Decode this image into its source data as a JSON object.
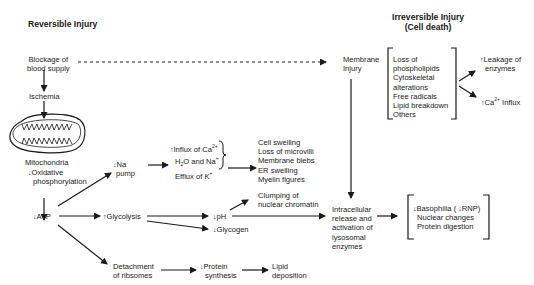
{
  "headings": {
    "reversible": "Reversible Injury",
    "irreversible_line1": "Irreversible Injury",
    "irreversible_line2": "(Cell death)"
  },
  "nodes": {
    "blockage": [
      "Blockage of",
      "blood supply"
    ],
    "ischemia": "Ischemia",
    "mitochondria": "Mitochondria",
    "oxidative": [
      "Oxidative",
      "phosphorylation"
    ],
    "atp": "ATP",
    "na_pump": [
      "Na",
      "pump"
    ],
    "influx": [
      "Influx of Ca",
      "H",
      "O  and Na",
      "Efflux of K"
    ],
    "swelling_list": [
      "Cell swelling",
      "Loss of microvilli",
      "Membrane blebs",
      "ER swelling",
      "Myelin figures"
    ],
    "glycolysis": "Glycolysis",
    "ph": "pH",
    "glycogen": "Glycogen",
    "clumping": [
      "Clumping of",
      "nuclear chromatin"
    ],
    "detachment": [
      "Detachment",
      "of ribsomes"
    ],
    "protein_synthesis": [
      "Protein",
      "synthesis"
    ],
    "lipid": [
      "Lipid",
      "deposition"
    ],
    "membrane_injury": [
      "Membrane",
      "Injury"
    ],
    "membrane_list": [
      "Loss of",
      "phospholipids",
      "Cytoskeletal",
      "alterations",
      "Free radicals",
      "Lipid breakdown",
      "Others"
    ],
    "leakage": [
      "Leakage of",
      "enzymes"
    ],
    "ca_influx": [
      "Ca",
      "Influx"
    ],
    "intracellular": [
      "Intracellular",
      "release and",
      "activation of",
      "lysosomal",
      "enzymes"
    ],
    "lysosomal_list": [
      "Basophilia (",
      "RNP)",
      "Nuclear changes",
      "Protein digestion"
    ]
  },
  "symbols": {
    "up": "↑",
    "down": "↓",
    "sup_2plus": "2+",
    "sup_plus": "+",
    "sub_2": "2"
  },
  "colors": {
    "ink": "#1a1a1a",
    "background": "#ffffff"
  }
}
